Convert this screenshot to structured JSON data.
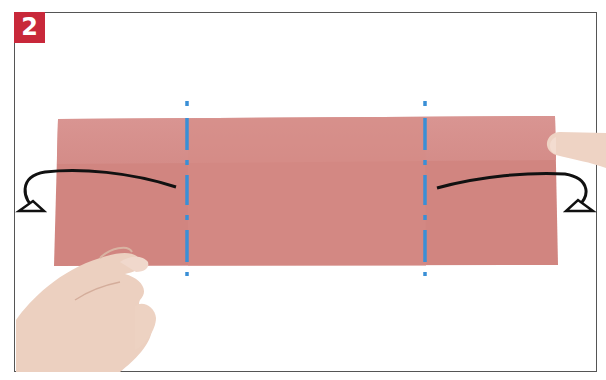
{
  "step": {
    "number": "2",
    "badge_color": "#c8283a"
  },
  "illustration": {
    "description": "Origami step: fold both ends of the pink paper strip backward along the dash-dot valley/mountain lines",
    "paper_color": "#d58a84",
    "fold_line_color": "#3a8fd6",
    "arrow_color": "#111111"
  }
}
